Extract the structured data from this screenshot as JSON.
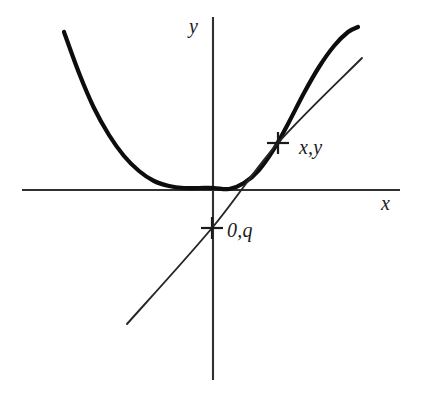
{
  "figure": {
    "kind": "line",
    "background_color": "#ffffff",
    "ink_color": "#0d0d0d",
    "axis_color": "#30302f",
    "tangent_color": "#26262a"
  },
  "axes": {
    "y_axis_label": "y",
    "x_axis_label": "x",
    "origin_px": {
      "x": 213,
      "y": 190
    },
    "x_axis_span_px": {
      "x1": 22,
      "y1": 190,
      "x2": 400,
      "y2": 190
    },
    "y_axis_span_px": {
      "x1": 213,
      "y1": 17,
      "x2": 213,
      "y2": 380
    },
    "grid": false,
    "ticks": []
  },
  "annotations": [
    {
      "id": "tangency-point",
      "label": "x,y",
      "marker": "cross",
      "marker_px": {
        "x": 278,
        "y": 143
      },
      "label_px": {
        "x": 299,
        "y": 137
      }
    },
    {
      "id": "y-intercept-point",
      "label": "0,q",
      "marker": "cross",
      "marker_px": {
        "x": 212,
        "y": 228
      },
      "label_px": {
        "x": 227,
        "y": 220
      }
    }
  ],
  "chart_data": {
    "type": "line",
    "title": "",
    "xlabel": "x",
    "ylabel": "y",
    "grid": false,
    "legend": "none",
    "series": [
      {
        "name": "parabola",
        "role": "curve",
        "stroke_width": 4.2,
        "points_px": [
          [
            64,
            32
          ],
          [
            79,
            73
          ],
          [
            94,
            108
          ],
          [
            109,
            135
          ],
          [
            124,
            156
          ],
          [
            139,
            171
          ],
          [
            154,
            181
          ],
          [
            169,
            186
          ],
          [
            184,
            188
          ],
          [
            199,
            188
          ],
          [
            214,
            188
          ],
          [
            229,
            189
          ],
          [
            244,
            183
          ],
          [
            259,
            170
          ],
          [
            274,
            149
          ],
          [
            289,
            122
          ],
          [
            304,
            93
          ],
          [
            319,
            67
          ],
          [
            334,
            46
          ],
          [
            348,
            32
          ],
          [
            358,
            27
          ]
        ]
      },
      {
        "name": "tangent-line",
        "role": "line",
        "stroke_width": 1.9,
        "points_px": [
          [
            127,
            324
          ],
          [
            212,
            228
          ],
          [
            278,
            143
          ],
          [
            362,
            58
          ]
        ]
      }
    ],
    "axis_ranges_px": {
      "x": [
        22,
        400
      ],
      "y": [
        17,
        380
      ]
    }
  }
}
